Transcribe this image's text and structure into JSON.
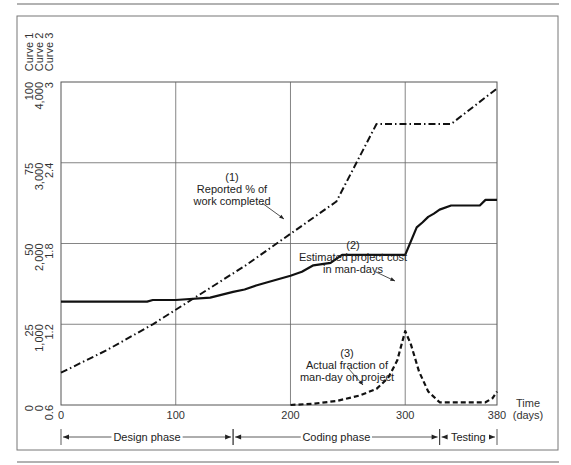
{
  "chart_data": {
    "type": "line",
    "title": "",
    "xlabel": "Time (days)",
    "xlabel_lines": [
      "Time",
      "(days)"
    ],
    "xlim": [
      0,
      380
    ],
    "x_ticks": [
      "0",
      "100",
      "200",
      "300",
      "380"
    ],
    "grid": true,
    "axis_headers": [
      "Curve 1",
      "Curve 2",
      "Curve 3"
    ],
    "y_axes": [
      {
        "curve": "Curve 1",
        "ticks": [
          "0",
          "25",
          "50",
          "75",
          "100"
        ],
        "range": [
          0,
          100
        ]
      },
      {
        "curve": "Curve 2",
        "ticks": [
          "0",
          "1,000",
          "2,000",
          "3,000",
          "4,000"
        ],
        "range": [
          0,
          4000
        ]
      },
      {
        "curve": "Curve 3",
        "ticks": [
          "0.6",
          "1.2",
          "1.8",
          "2.4",
          "3"
        ],
        "range": [
          0.6,
          3
        ]
      }
    ],
    "series": [
      {
        "name": "(1) Reported % of work completed",
        "label_lines": [
          "(1)",
          "Reported % of",
          "work completed"
        ],
        "style": "dash-dot",
        "axis": "Curve 1",
        "x": [
          0,
          40,
          80,
          120,
          160,
          200,
          240,
          275,
          290,
          340,
          380
        ],
        "y": [
          10,
          17,
          25,
          34,
          43,
          53,
          63,
          87,
          87,
          87,
          98
        ]
      },
      {
        "name": "(2) Estimated project cost in man-days",
        "label_lines": [
          "(2)",
          "Estimated project cost",
          "in man-days"
        ],
        "style": "solid",
        "axis": "Curve 2",
        "x": [
          0,
          75,
          80,
          100,
          130,
          150,
          160,
          170,
          180,
          190,
          200,
          210,
          220,
          235,
          245,
          265,
          270,
          280,
          300,
          310,
          315,
          320,
          325,
          330,
          340,
          365,
          370,
          380
        ],
        "y": [
          1280,
          1280,
          1300,
          1300,
          1330,
          1400,
          1430,
          1480,
          1520,
          1560,
          1600,
          1650,
          1730,
          1760,
          1860,
          1860,
          1860,
          1860,
          1860,
          2200,
          2260,
          2330,
          2370,
          2420,
          2470,
          2470,
          2540,
          2540
        ]
      },
      {
        "name": "(3) Actual fraction of man-day on project",
        "label_lines": [
          "(3)",
          "Actual fraction of",
          "man-day on project"
        ],
        "style": "dashed",
        "axis": "Curve 3",
        "x": [
          200,
          220,
          240,
          260,
          275,
          285,
          293,
          300,
          305,
          312,
          320,
          330,
          370,
          376,
          380
        ],
        "y": [
          0.6,
          0.61,
          0.63,
          0.67,
          0.72,
          0.8,
          0.93,
          1.15,
          1.05,
          0.85,
          0.7,
          0.62,
          0.62,
          0.65,
          0.7
        ]
      }
    ],
    "phases": [
      {
        "label": "Design phase",
        "start": 0,
        "end": 150
      },
      {
        "label": "Coding phase",
        "start": 150,
        "end": 330
      },
      {
        "label": "Testing",
        "start": 330,
        "end": 380
      }
    ],
    "legend_position": "inline annotations"
  }
}
